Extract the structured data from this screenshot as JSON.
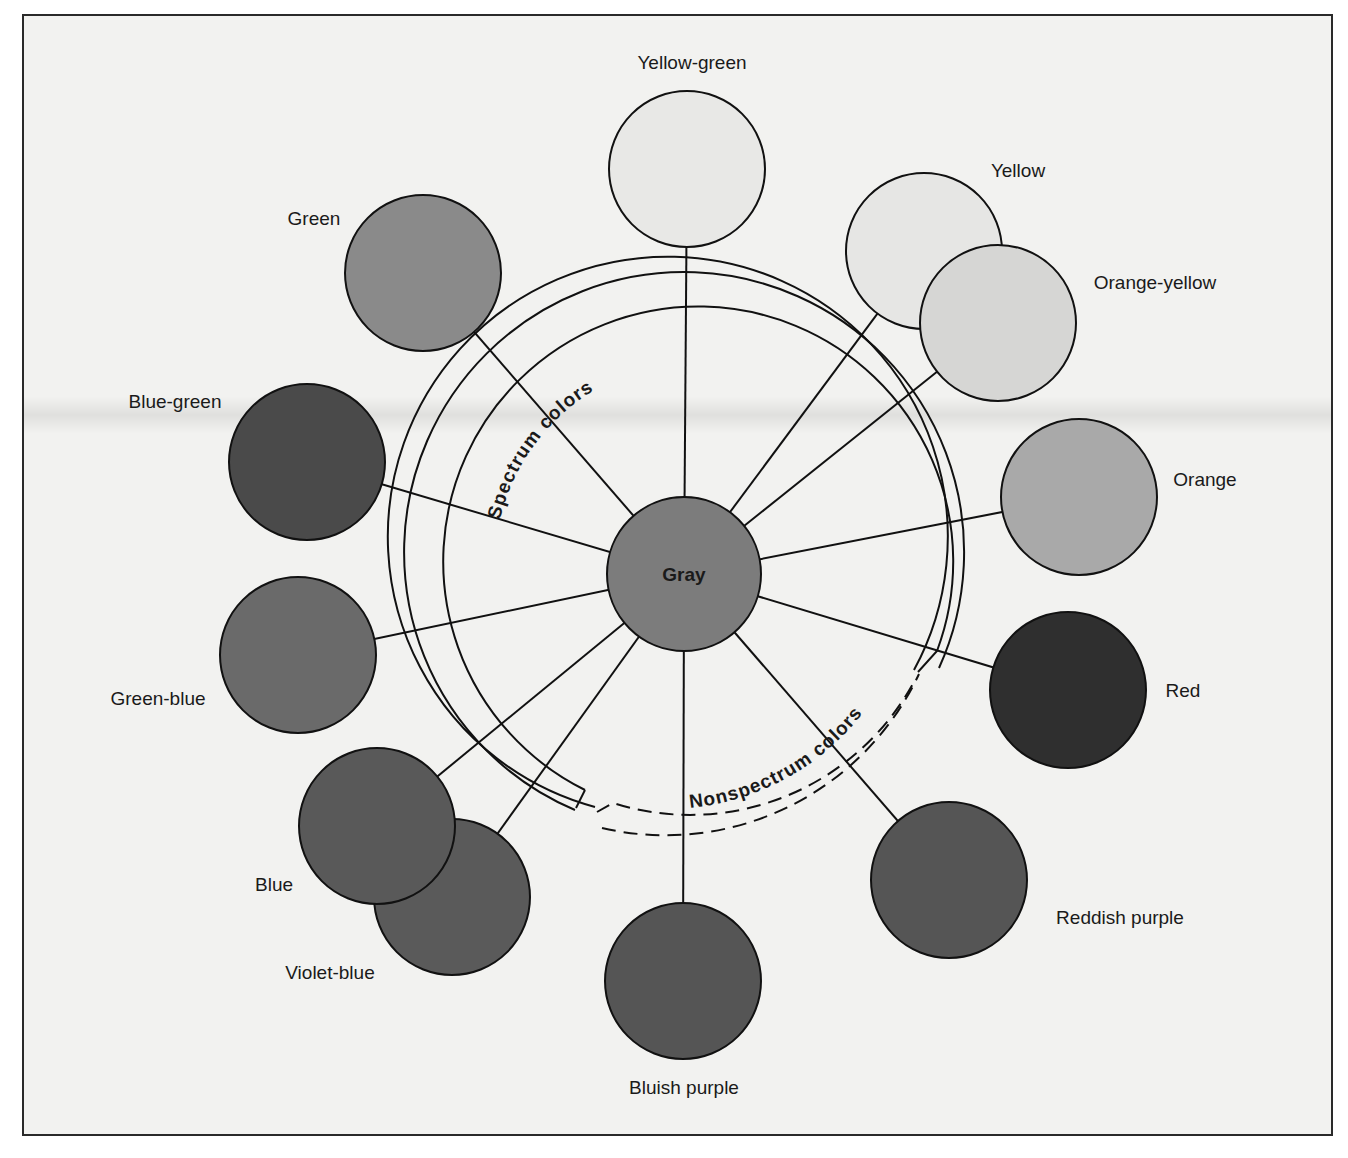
{
  "diagram": {
    "center": {
      "label": "Gray",
      "cx": 684,
      "cy": 574,
      "r": 77,
      "fill": "#7c7c7c"
    },
    "arcs": {
      "spectrum_label": "Spectrum colors",
      "nonspectrum_label": "Nonspectrum colors"
    },
    "circles": [
      {
        "id": "yellow-green",
        "label": "Yellow-green",
        "cx": 687,
        "cy": 169,
        "r": 78,
        "fill": "#e8e8e6",
        "lx": 692,
        "ly": 69,
        "anchor": "middle"
      },
      {
        "id": "yellow",
        "label": "Yellow",
        "cx": 924,
        "cy": 251,
        "r": 78,
        "fill": "#e6e6e4",
        "lx": 1018,
        "ly": 177,
        "anchor": "middle"
      },
      {
        "id": "orange-yellow",
        "label": "Orange-yellow",
        "cx": 998,
        "cy": 323,
        "r": 78,
        "fill": "#d6d6d4",
        "lx": 1155,
        "ly": 289,
        "anchor": "middle"
      },
      {
        "id": "orange",
        "label": "Orange",
        "cx": 1079,
        "cy": 497,
        "r": 78,
        "fill": "#a9a9a9",
        "lx": 1205,
        "ly": 486,
        "anchor": "middle"
      },
      {
        "id": "red",
        "label": "Red",
        "cx": 1068,
        "cy": 690,
        "r": 78,
        "fill": "#2f2f2f",
        "lx": 1183,
        "ly": 697,
        "anchor": "middle"
      },
      {
        "id": "reddish-purple",
        "label": "Reddish purple",
        "cx": 949,
        "cy": 880,
        "r": 78,
        "fill": "#555555",
        "lx": 1120,
        "ly": 924,
        "anchor": "middle"
      },
      {
        "id": "bluish-purple",
        "label": "Bluish purple",
        "cx": 683,
        "cy": 981,
        "r": 78,
        "fill": "#555555",
        "lx": 684,
        "ly": 1094,
        "anchor": "middle"
      },
      {
        "id": "violet-blue",
        "label": "Violet-blue",
        "cx": 452,
        "cy": 897,
        "r": 78,
        "fill": "#5a5a5a",
        "lx": 330,
        "ly": 979,
        "anchor": "middle"
      },
      {
        "id": "blue",
        "label": "Blue",
        "cx": 377,
        "cy": 826,
        "r": 78,
        "fill": "#595959",
        "lx": 274,
        "ly": 891,
        "anchor": "middle"
      },
      {
        "id": "green-blue",
        "label": "Green-blue",
        "cx": 298,
        "cy": 655,
        "r": 78,
        "fill": "#6a6a6a",
        "lx": 158,
        "ly": 705,
        "anchor": "middle"
      },
      {
        "id": "blue-green",
        "label": "Blue-green",
        "cx": 307,
        "cy": 462,
        "r": 78,
        "fill": "#4a4a4a",
        "lx": 175,
        "ly": 408,
        "anchor": "middle"
      },
      {
        "id": "green",
        "label": "Green",
        "cx": 423,
        "cy": 273,
        "r": 78,
        "fill": "#8a8a8a",
        "lx": 314,
        "ly": 225,
        "anchor": "middle"
      }
    ]
  }
}
